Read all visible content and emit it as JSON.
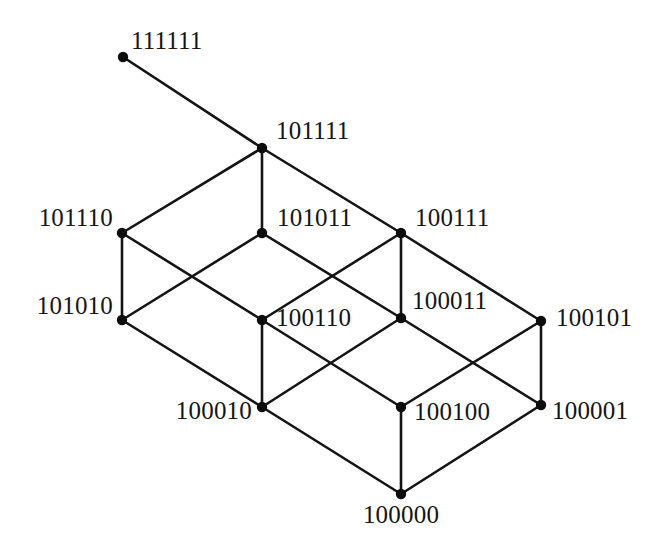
{
  "figure": {
    "kind": "hasse-diagram",
    "background_color": "#ffffff",
    "edge_color": "#141414",
    "vertex_color": "#0d0d0d",
    "width": 662,
    "height": 552
  },
  "nodes": [
    {
      "id": "n0",
      "label": "111111",
      "x": 123,
      "y": 57,
      "label_x": 131,
      "label_y": 28,
      "label_anchor": "start"
    },
    {
      "id": "n1",
      "label": "101111",
      "x": 262,
      "y": 148,
      "label_x": 276,
      "label_y": 118,
      "label_anchor": "start"
    },
    {
      "id": "n2",
      "label": "101110",
      "x": 122,
      "y": 233,
      "label_x": 113,
      "label_y": 205,
      "label_anchor": "end"
    },
    {
      "id": "n3",
      "label": "101011",
      "x": 262,
      "y": 233,
      "label_x": 277,
      "label_y": 205,
      "label_anchor": "start"
    },
    {
      "id": "n4",
      "label": "100111",
      "x": 401,
      "y": 233,
      "label_x": 415,
      "label_y": 205,
      "label_anchor": "start"
    },
    {
      "id": "n5",
      "label": "101010",
      "x": 122,
      "y": 320,
      "label_x": 113,
      "label_y": 293,
      "label_anchor": "end"
    },
    {
      "id": "n6",
      "label": "100110",
      "x": 262,
      "y": 320,
      "label_x": 276,
      "label_y": 305,
      "label_anchor": "start"
    },
    {
      "id": "n7",
      "label": "100011",
      "x": 401,
      "y": 318,
      "label_x": 412,
      "label_y": 288,
      "label_anchor": "start"
    },
    {
      "id": "n8",
      "label": "100101",
      "x": 541,
      "y": 321,
      "label_x": 556,
      "label_y": 305,
      "label_anchor": "start"
    },
    {
      "id": "n9",
      "label": "100010",
      "x": 262,
      "y": 407,
      "label_x": 252,
      "label_y": 398,
      "label_anchor": "end"
    },
    {
      "id": "n10",
      "label": "100100",
      "x": 401,
      "y": 407,
      "label_x": 414,
      "label_y": 399,
      "label_anchor": "start"
    },
    {
      "id": "n11",
      "label": "100001",
      "x": 541,
      "y": 405,
      "label_x": 552,
      "label_y": 398,
      "label_anchor": "start"
    },
    {
      "id": "n12",
      "label": "100000",
      "x": 401,
      "y": 494,
      "label_x": 401,
      "label_y": 502,
      "label_anchor": "middle"
    }
  ],
  "edges": [
    {
      "from": "n0",
      "to": "n1",
      "name": "edge-111111-101111"
    },
    {
      "from": "n1",
      "to": "n2",
      "name": "edge-101111-101110"
    },
    {
      "from": "n1",
      "to": "n3",
      "name": "edge-101111-101011"
    },
    {
      "from": "n1",
      "to": "n4",
      "name": "edge-101111-100111"
    },
    {
      "from": "n2",
      "to": "n5",
      "name": "edge-101110-101010"
    },
    {
      "from": "n2",
      "to": "n6",
      "name": "edge-101110-100110"
    },
    {
      "from": "n3",
      "to": "n5",
      "name": "edge-101011-101010"
    },
    {
      "from": "n3",
      "to": "n7",
      "name": "edge-101011-100011"
    },
    {
      "from": "n4",
      "to": "n6",
      "name": "edge-100111-100110"
    },
    {
      "from": "n4",
      "to": "n7",
      "name": "edge-100111-100011"
    },
    {
      "from": "n4",
      "to": "n8",
      "name": "edge-100111-100101"
    },
    {
      "from": "n5",
      "to": "n9",
      "name": "edge-101010-100010"
    },
    {
      "from": "n6",
      "to": "n9",
      "name": "edge-100110-100010"
    },
    {
      "from": "n6",
      "to": "n10",
      "name": "edge-100110-100100"
    },
    {
      "from": "n7",
      "to": "n9",
      "name": "edge-100011-100010"
    },
    {
      "from": "n7",
      "to": "n11",
      "name": "edge-100011-100001"
    },
    {
      "from": "n8",
      "to": "n10",
      "name": "edge-100101-100100"
    },
    {
      "from": "n8",
      "to": "n11",
      "name": "edge-100101-100001"
    },
    {
      "from": "n9",
      "to": "n12",
      "name": "edge-100010-100000"
    },
    {
      "from": "n10",
      "to": "n12",
      "name": "edge-100100-100000"
    },
    {
      "from": "n11",
      "to": "n12",
      "name": "edge-100001-100000"
    }
  ],
  "vertex_radius": 5.2
}
